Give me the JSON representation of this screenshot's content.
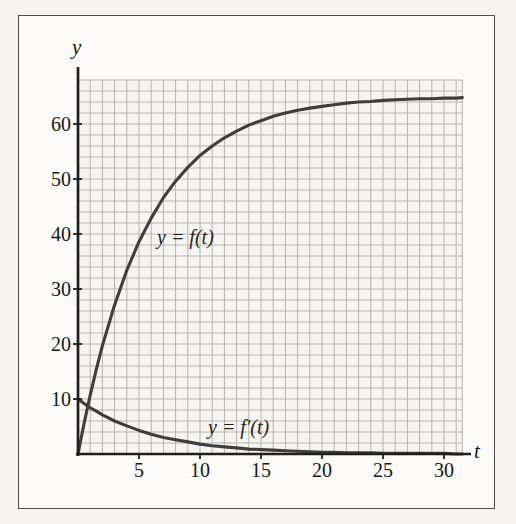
{
  "chart_data": {
    "type": "line",
    "title": "",
    "xlabel": "t",
    "ylabel": "y",
    "xlim": [
      0,
      31.5
    ],
    "ylim": [
      0,
      68
    ],
    "x_ticks": [
      5,
      10,
      15,
      20,
      25,
      30
    ],
    "y_ticks": [
      10,
      20,
      30,
      40,
      50,
      60
    ],
    "grid": {
      "on": true,
      "x_step": 1,
      "y_step": 2
    },
    "x": [
      0,
      0.5,
      1,
      1.5,
      2,
      3,
      4,
      5,
      6,
      7,
      8,
      9,
      10,
      11,
      12,
      13,
      14,
      15,
      16,
      17,
      18,
      19,
      20,
      21,
      22,
      23,
      24,
      25,
      26,
      27,
      28,
      29,
      30,
      31,
      31.5
    ],
    "series": [
      {
        "name": "y = f(t)",
        "values": [
          0,
          5.6,
          10.7,
          15.4,
          19.7,
          27.1,
          33.4,
          38.6,
          42.9,
          46.6,
          49.6,
          52.1,
          54.3,
          56.0,
          57.5,
          58.7,
          59.8,
          60.6,
          61.4,
          62.0,
          62.5,
          62.9,
          63.2,
          63.5,
          63.8,
          64.0,
          64.1,
          64.3,
          64.4,
          64.5,
          64.6,
          64.6,
          64.7,
          64.7,
          64.8
        ]
      },
      {
        "name": "y = f′(t)",
        "values": [
          10,
          9.2,
          8.4,
          7.8,
          7.1,
          6.0,
          5.1,
          4.3,
          3.6,
          3.0,
          2.6,
          2.2,
          1.8,
          1.5,
          1.3,
          1.1,
          0.9,
          0.8,
          0.7,
          0.6,
          0.5,
          0.4,
          0.3,
          0.3,
          0.2,
          0.2,
          0.2,
          0.1,
          0.1,
          0.1,
          0.1,
          0.1,
          0.1,
          0.0,
          0.0
        ]
      }
    ],
    "legend_position": "inline-annotations",
    "colors": {
      "curve": "#3e3e3e",
      "axis": "#1f1f1f",
      "grid": "#b4b4b0",
      "text": "#161616",
      "paper": "#fcfbf8",
      "grid_bg": "#f6f5f1",
      "border": "#4e4e4e"
    }
  }
}
